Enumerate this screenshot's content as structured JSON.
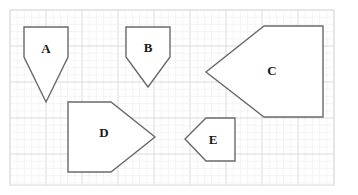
{
  "diagram": {
    "type": "grid-shapes",
    "grid": {
      "x0": 10,
      "y0": 10,
      "x1": 334,
      "y1": 185,
      "minor_step": 7.2,
      "major_step": 36,
      "minor_color": "#ececec",
      "major_color": "#d6d6d6"
    },
    "shapes": [
      {
        "id": "A",
        "label": "A",
        "points": "24,27 68,27 68,57 46,102 24,57",
        "label_x": 46,
        "label_y": 50
      },
      {
        "id": "B",
        "label": "B",
        "points": "126,27 170,27 170,57 148,87 126,57",
        "label_x": 148,
        "label_y": 49
      },
      {
        "id": "C",
        "label": "C",
        "points": "264,26 323,26 323,117 264,117 206,72",
        "label_x": 272,
        "label_y": 72
      },
      {
        "id": "D",
        "label": "D",
        "points": "68,102 111,102 155,137 111,172 68,172",
        "label_x": 104,
        "label_y": 134
      },
      {
        "id": "E",
        "label": "E",
        "points": "206,118 235,118 235,161 206,161 185,139",
        "label_x": 213,
        "label_y": 141
      }
    ],
    "stroke_color": "#6a6a6a"
  }
}
